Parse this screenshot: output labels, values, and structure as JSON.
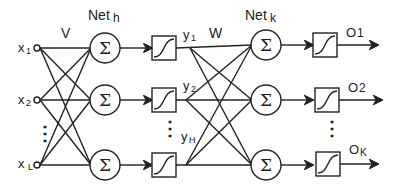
{
  "diagram": {
    "type": "feedforward-neural-network",
    "weights": {
      "input_to_hidden": "V",
      "hidden_to_output": "W"
    },
    "layer_labels": {
      "hidden_net": "Net",
      "hidden_net_sub": "h",
      "output_net": "Net",
      "output_net_sub": "k"
    },
    "inputs": [
      {
        "label": "x",
        "sub": "1"
      },
      {
        "label": "x",
        "sub": "2"
      },
      {
        "label": "x",
        "sub": "L"
      }
    ],
    "hidden_outputs": [
      {
        "label": "y",
        "sub": "1"
      },
      {
        "label": "y",
        "sub": "2"
      },
      {
        "label": "y",
        "sub": "H"
      }
    ],
    "outputs": [
      {
        "label": "O",
        "sub": "1"
      },
      {
        "label": "O",
        "sub": "2"
      },
      {
        "label": "O",
        "sub": "K"
      }
    ],
    "sum_symbol": "Σ",
    "ellipsis": "⋮",
    "stroke_color": "#222222",
    "background": "#ffffff"
  }
}
